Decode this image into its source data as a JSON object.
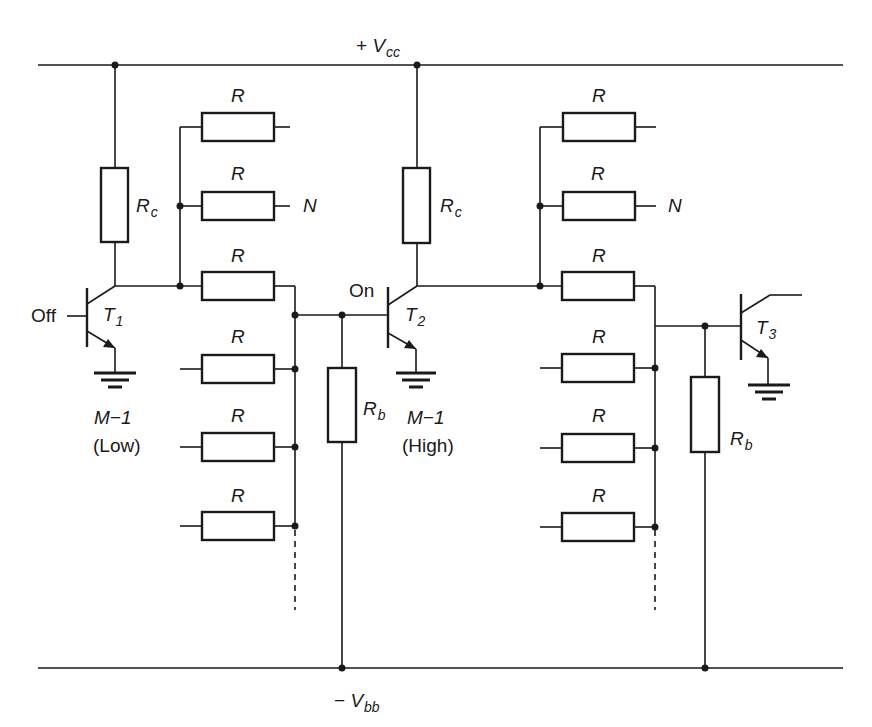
{
  "diagram": {
    "type": "circuit-schematic",
    "rails": {
      "top": {
        "label_sign": "+",
        "label_main": "V",
        "label_sub": "cc"
      },
      "bottom": {
        "label_sign": "−",
        "label_main": "V",
        "label_sub": "bb"
      }
    },
    "transistors": [
      {
        "id": "T1",
        "main": "T",
        "sub": "1",
        "state": "Off",
        "group_label": "M−1",
        "level": "(Low)"
      },
      {
        "id": "T2",
        "main": "T",
        "sub": "2",
        "state": "On",
        "group_label": "M−1",
        "level": "(High)"
      },
      {
        "id": "T3",
        "main": "T",
        "sub": "3"
      }
    ],
    "resistors": {
      "collector": {
        "main": "R",
        "sub": "c"
      },
      "base": {
        "main": "R",
        "sub": "b"
      },
      "coupling": "R"
    },
    "fanout_label": "N",
    "stage1_coupling_count": 6,
    "stage2_coupling_count": 6
  }
}
